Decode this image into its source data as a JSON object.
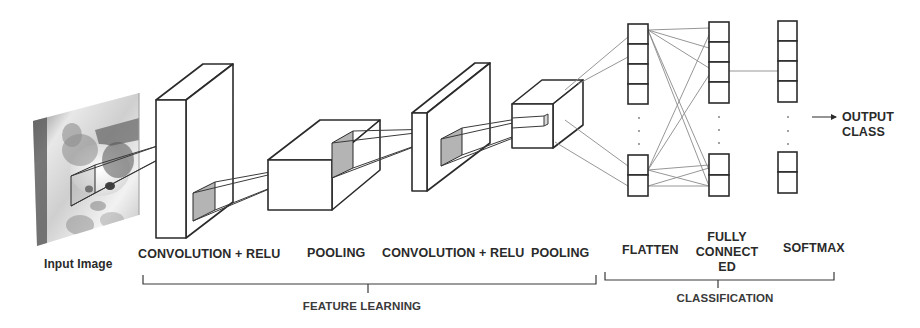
{
  "diagram": {
    "input": {
      "label": "Input Image",
      "image_subject": "kitten (grayscale photo)"
    },
    "stages": [
      {
        "id": "conv1",
        "label": "CONVOLUTION + RELU",
        "kind": "convolution"
      },
      {
        "id": "pool1",
        "label": "POOLING",
        "kind": "pooling"
      },
      {
        "id": "conv2",
        "label": "CONVOLUTION + RELU",
        "kind": "convolution"
      },
      {
        "id": "pool2",
        "label": "POOLING",
        "kind": "pooling"
      },
      {
        "id": "flatten",
        "label": "FLATTEN",
        "kind": "vector"
      },
      {
        "id": "fc",
        "label_lines": [
          "FULLY",
          "CONNECT",
          "ED"
        ],
        "kind": "vector"
      },
      {
        "id": "softmax",
        "label": "SOFTMAX",
        "kind": "vector"
      }
    ],
    "output": {
      "label_lines": [
        "OUTPUT",
        "CLASS"
      ],
      "arrow": "right-arrow"
    },
    "groups": [
      {
        "id": "feature-learning",
        "label": "FEATURE LEARNING",
        "spans": [
          "conv1",
          "pool1",
          "conv2",
          "pool2"
        ]
      },
      {
        "id": "classification",
        "label": "CLASSIFICATION",
        "spans": [
          "flatten",
          "fc",
          "softmax"
        ]
      }
    ],
    "vector_columns": {
      "top_cells": 4,
      "bottom_cells": 2,
      "ellipsis": "⋮"
    },
    "colors": {
      "stroke": "#2b2b2b",
      "connector": "#8a8a8a",
      "patch_fill": "#b4b4b4",
      "text": "#2a2a2a"
    }
  }
}
